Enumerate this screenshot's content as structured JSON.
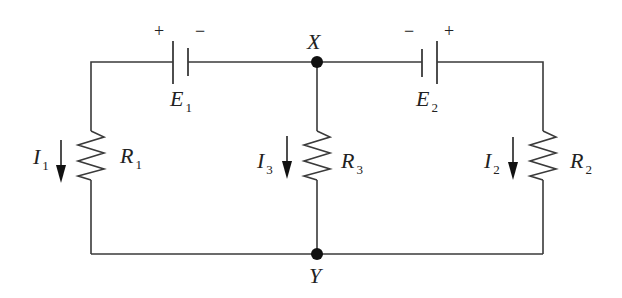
{
  "diagram": {
    "type": "circuit",
    "nodes": [
      {
        "id": "X",
        "label": "X",
        "x": 317,
        "y": 62
      },
      {
        "id": "Y",
        "label": "Y",
        "x": 317,
        "y": 254
      }
    ],
    "sources": [
      {
        "id": "E1",
        "symbol": "E",
        "subscript": "1",
        "left_sign": "+",
        "right_sign": "−"
      },
      {
        "id": "E2",
        "symbol": "E",
        "subscript": "2",
        "left_sign": "−",
        "right_sign": "+"
      }
    ],
    "resistors": [
      {
        "id": "R1",
        "symbol": "R",
        "subscript": "1",
        "branch": "left"
      },
      {
        "id": "R3",
        "symbol": "R",
        "subscript": "3",
        "branch": "middle"
      },
      {
        "id": "R2",
        "symbol": "R",
        "subscript": "2",
        "branch": "right"
      }
    ],
    "currents": [
      {
        "id": "I1",
        "symbol": "I",
        "subscript": "1",
        "direction": "down"
      },
      {
        "id": "I3",
        "symbol": "I",
        "subscript": "3",
        "direction": "down"
      },
      {
        "id": "I2",
        "symbol": "I",
        "subscript": "2",
        "direction": "down"
      }
    ],
    "colors": {
      "line": "#3a3a3a",
      "node": "#111111",
      "text": "#222222",
      "background": "#ffffff"
    }
  }
}
